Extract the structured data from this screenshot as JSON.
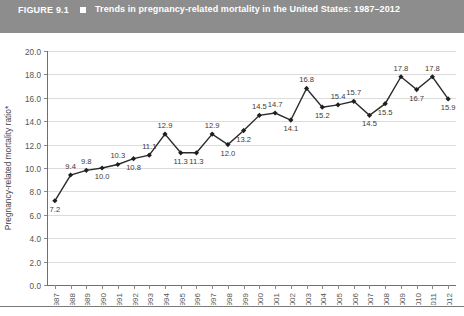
{
  "header": {
    "figure_number": "FIGURE 9.1",
    "bullet_icon": "square-bullet-icon",
    "title": "Trends in pregnancy-related mortality in the United States: 1987–2012",
    "bar_color": "#8d8d8d",
    "text_color": "#ffffff"
  },
  "chart_data": {
    "type": "line",
    "title": "Trends in pregnancy-related mortality in the United States: 1987–2012",
    "xlabel": "",
    "ylabel": "Pregnancy-related mortality ratio*",
    "categories": [
      "1987",
      "1988",
      "1989",
      "1990",
      "1991",
      "1992",
      "1993",
      "1994",
      "1995",
      "1996",
      "1997",
      "1998",
      "1999",
      "2000",
      "2001",
      "2002",
      "2003",
      "2004",
      "2005",
      "2006",
      "2007",
      "2008",
      "2009",
      "2010",
      "2011",
      "2012"
    ],
    "values": [
      7.2,
      9.4,
      9.8,
      10.0,
      10.3,
      10.8,
      11.1,
      12.9,
      11.3,
      11.3,
      12.9,
      12.0,
      13.2,
      14.5,
      14.7,
      14.1,
      16.8,
      15.2,
      15.4,
      15.7,
      14.5,
      15.5,
      17.8,
      16.7,
      17.8,
      15.9
    ],
    "data_labels": [
      "7.2",
      "9.4",
      "9.8",
      "10.0",
      "10.3",
      "10.8",
      "11.1",
      "12.9",
      "11.3",
      "11.3",
      "12.9",
      "12.0",
      "13.2",
      "14.5",
      "14.7",
      "14.1",
      "16.8",
      "15.2",
      "15.4",
      "15.7",
      "14.5",
      "15.5",
      "17.8",
      "16.7",
      "17.8",
      "15.9"
    ],
    "label_placement": [
      "below",
      "above",
      "above",
      "below",
      "above",
      "below",
      "above",
      "above",
      "below",
      "below",
      "above",
      "below",
      "below",
      "above",
      "above",
      "below",
      "above",
      "below",
      "above",
      "above",
      "below",
      "below",
      "above",
      "below",
      "above",
      "below"
    ],
    "ylim": [
      0.0,
      20.0
    ],
    "ytick_labels": [
      "0.0",
      "2.0",
      "4.0",
      "6.0",
      "8.0",
      "10.0",
      "12.0",
      "14.0",
      "16.0",
      "18.0",
      "20.0"
    ],
    "ytick_values": [
      0.0,
      2.0,
      4.0,
      6.0,
      8.0,
      10.0,
      12.0,
      14.0,
      16.0,
      18.0,
      20.0
    ],
    "grid": true,
    "legend": false,
    "series_color": "#1f1f1f",
    "grid_color": "#dcdcdc",
    "axis_color": "#6f6f6f",
    "marker": "diamond"
  }
}
